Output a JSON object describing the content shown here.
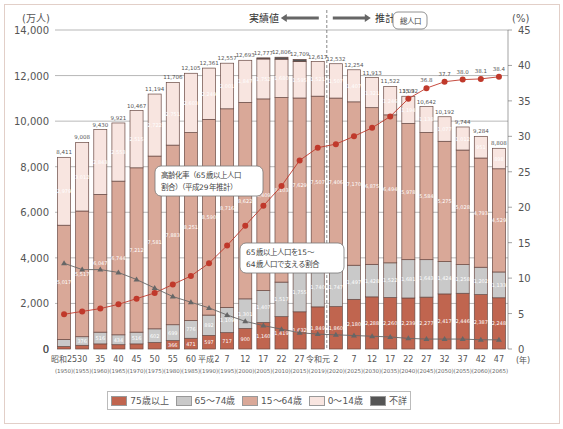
{
  "chart_data": {
    "type": "bar",
    "stacked": true,
    "title": "",
    "ylabel": "(万人)",
    "ylabel_right": "(%)",
    "xlabel": "(年)",
    "ylim": [
      0,
      14000
    ],
    "ylim_right": [
      0,
      45
    ],
    "yticks": [
      "0",
      "2,000",
      "4,000",
      "6,000",
      "8,000",
      "10,000",
      "12,000",
      "14,000"
    ],
    "yticks_right": [
      "0",
      "5",
      "10",
      "15",
      "20",
      "25",
      "30",
      "35",
      "40",
      "45"
    ],
    "header_actual": "実績値",
    "header_projected": "推計値",
    "categories": [
      "昭和25",
      "30",
      "35",
      "40",
      "45",
      "50",
      "55",
      "60",
      "平成2",
      "7",
      "12",
      "17",
      "22",
      "27",
      "令和元",
      "2",
      "7",
      "12",
      "17",
      "22",
      "27",
      "32",
      "37",
      "42",
      "47"
    ],
    "categories_western": [
      "(1950)",
      "(1955)",
      "(1960)",
      "(1965)",
      "(1970)",
      "(1975)",
      "(1980)",
      "(1985)",
      "(1990)",
      "(1995)",
      "(2000)",
      "(2005)",
      "(2010)",
      "(2015)",
      "(2019)",
      "(2020)",
      "(2025)",
      "(2030)",
      "(2035)",
      "(2040)",
      "(2045)",
      "(2050)",
      "(2055)",
      "(2060)",
      "(2065)"
    ],
    "totals": [
      "8,411",
      "9,008",
      "9,430",
      "9,921",
      "10,467",
      "11,194",
      "11,706",
      "12,105",
      "12,361",
      "12,557",
      "12,693",
      "12,777",
      "12,806",
      "12,709",
      "12,617",
      "12,532",
      "12,254",
      "11,913",
      "11,522",
      "11,092",
      "10,642",
      "10,192",
      "9,744",
      "9,284",
      "8,808"
    ],
    "series": [
      {
        "name": "75歳以上",
        "color": "#c0654f",
        "values": [
          107,
          163,
          224,
          189,
          224,
          284,
          366,
          471,
          597,
          717,
          900,
          1160,
          1419,
          1632,
          1849,
          1860,
          2180,
          2288,
          2260,
          2239,
          2277,
          2417,
          2446,
          2387,
          2248
        ]
      },
      {
        "name": "65〜74歳",
        "color": "#c9c9c9",
        "values": [
          309,
          376,
          516,
          434,
          516,
          602,
          699,
          776,
          892,
          1109,
          1301,
          1407,
          1517,
          1755,
          1740,
          1747,
          1497,
          1428,
          1522,
          1681,
          1643,
          1424,
          1258,
          1202,
          1133
        ]
      },
      {
        "name": "15〜64歳",
        "color": "#d9a898",
        "values": [
          5017,
          5517,
          6047,
          6744,
          7212,
          7581,
          7883,
          8251,
          8590,
          8716,
          8622,
          8409,
          8103,
          7629,
          7507,
          7406,
          7170,
          6875,
          6494,
          5978,
          5584,
          5275,
          5028,
          4793,
          4529
        ]
      },
      {
        "name": "0〜14歳",
        "color": "#f8e5e0",
        "values": [
          2979,
          3012,
          2843,
          2553,
          2515,
          2722,
          2751,
          2603,
          2249,
          2001,
          1847,
          1752,
          1680,
          1595,
          1521,
          1507,
          1407,
          1321,
          1246,
          1194,
          1138,
          1077,
          1012,
          951,
          898
        ]
      },
      {
        "name": "不詳",
        "color": "#555555",
        "values": [
          0,
          0,
          0,
          0,
          0,
          0,
          0,
          0,
          0,
          0,
          0,
          49,
          86,
          98,
          0,
          0,
          0,
          0,
          0,
          0,
          0,
          0,
          0,
          0,
          0
        ]
      }
    ],
    "lines": [
      {
        "name": "高齢化率（65歳以上人口割合）（平成29年推計）",
        "axis": "right",
        "color": "#c0392b",
        "marker": "circle",
        "values": [
          4.9,
          5.3,
          5.7,
          6.3,
          7.1,
          7.9,
          9.1,
          10.3,
          12.1,
          14.6,
          17.4,
          20.2,
          23.0,
          26.6,
          28.4,
          28.9,
          30.0,
          31.2,
          32.8,
          35.3,
          36.8,
          37.7,
          38.0,
          38.1,
          38.4
        ]
      },
      {
        "name": "65歳以上人口を15〜64歳人口で支える割合",
        "axis": "right",
        "color": "#666666",
        "marker": "triangle",
        "values": [
          12.1,
          11.2,
          11.2,
          10.8,
          9.8,
          8.6,
          7.4,
          6.6,
          5.8,
          4.8,
          3.9,
          3.3,
          2.8,
          2.3,
          2.1,
          2.0,
          1.9,
          1.8,
          1.7,
          1.5,
          1.4,
          1.4,
          1.4,
          1.3,
          1.3
        ]
      }
    ],
    "annotations": {
      "total_callout": "総人口",
      "aging_callout_1": "高齢化率（65歳以上人口",
      "aging_callout_2": "割合）（平成29年推計）",
      "support_callout_1": "65歳以上人口を15〜",
      "support_callout_2": "64歳人口で支える割合"
    },
    "legend_position": "bottom",
    "grid": true
  },
  "legend": {
    "items": [
      {
        "label": "75歳以上",
        "color": "#c0654f"
      },
      {
        "label": "65〜74歳",
        "color": "#c9c9c9"
      },
      {
        "label": "15〜64歳",
        "color": "#d9a898"
      },
      {
        "label": "0〜14歳",
        "color": "#f8e5e0"
      },
      {
        "label": "不詳",
        "color": "#555555"
      }
    ]
  }
}
